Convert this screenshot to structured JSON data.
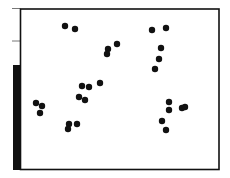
{
  "chart_data": {
    "type": "scatter",
    "title": "",
    "xlabel": "",
    "ylabel": "",
    "grid": false,
    "legend": null,
    "frame": {
      "left": 20.5,
      "top": 9,
      "right": 219,
      "bottom": 169.5
    },
    "left_ticks_y": [
      8.5,
      41
    ],
    "side_bar": {
      "x": 13,
      "width": 8,
      "top": 65,
      "bottom": 170,
      "color": "#111111"
    },
    "marker_color": "#111111",
    "marker_radius": 3.2,
    "points_px": [
      [
        65,
        26
      ],
      [
        75,
        29
      ],
      [
        117,
        44
      ],
      [
        108,
        49
      ],
      [
        107,
        54
      ],
      [
        152,
        30
      ],
      [
        166,
        28
      ],
      [
        161,
        48
      ],
      [
        159,
        59
      ],
      [
        155,
        69
      ],
      [
        36,
        103
      ],
      [
        42,
        106
      ],
      [
        40,
        113
      ],
      [
        82,
        86
      ],
      [
        89,
        87
      ],
      [
        100,
        83
      ],
      [
        79,
        97
      ],
      [
        85,
        100
      ],
      [
        77,
        124
      ],
      [
        69,
        124
      ],
      [
        68,
        129
      ],
      [
        169,
        102
      ],
      [
        169,
        110
      ],
      [
        182,
        108
      ],
      [
        185,
        107
      ],
      [
        162,
        121
      ],
      [
        166,
        130
      ]
    ]
  }
}
